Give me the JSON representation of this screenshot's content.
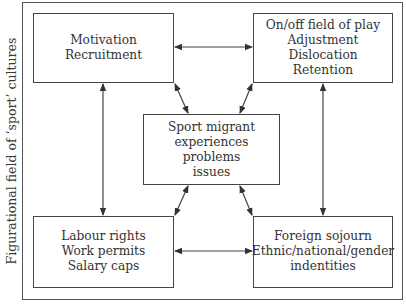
{
  "diagram": {
    "side_label": "Figurational field of ‘sport’ cultures",
    "boxes": {
      "top_left": {
        "lines": [
          "Motivation",
          "Recruitment"
        ]
      },
      "top_right": {
        "lines": [
          "On/off field of play",
          "Adjustment",
          "Dislocation",
          "Retention"
        ]
      },
      "center": {
        "lines": [
          "Sport migrant",
          "experiences",
          "problems",
          "issues"
        ]
      },
      "bottom_left": {
        "lines": [
          "Labour rights",
          "Work permits",
          "Salary caps"
        ]
      },
      "bottom_right": {
        "lines": [
          "Foreign sojourn",
          "Ethnic/national/gender",
          "indentities"
        ]
      }
    },
    "connections": [
      {
        "from": "top_left",
        "to": "top_right",
        "type": "bidirectional"
      },
      {
        "from": "bottom_left",
        "to": "bottom_right",
        "type": "bidirectional"
      },
      {
        "from": "top_left",
        "to": "bottom_left",
        "type": "bidirectional"
      },
      {
        "from": "top_right",
        "to": "bottom_right",
        "type": "bidirectional"
      },
      {
        "from": "center",
        "to": "top_left",
        "type": "bidirectional"
      },
      {
        "from": "center",
        "to": "top_right",
        "type": "bidirectional"
      },
      {
        "from": "center",
        "to": "bottom_left",
        "type": "bidirectional"
      },
      {
        "from": "center",
        "to": "bottom_right",
        "type": "bidirectional"
      }
    ],
    "colors": {
      "line": "#444444",
      "text": "#333333",
      "background": "#ffffff"
    }
  }
}
